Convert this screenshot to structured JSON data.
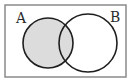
{
  "diagram": {
    "type": "venn",
    "universe": {
      "x": 5,
      "y": 5,
      "width": 121,
      "height": 72,
      "stroke": "#8a8a8a"
    },
    "sets": [
      {
        "label": "A",
        "cx": 48,
        "cy": 43,
        "r": 25,
        "label_x": 16,
        "label_y": 23,
        "shaded": true
      },
      {
        "label": "B",
        "cx": 88,
        "cy": 43,
        "r": 29,
        "label_x": 110,
        "label_y": 22,
        "shaded": false
      }
    ],
    "shaded_region": "A",
    "fill_color": "#dcdcdc",
    "stroke_color": "#1e1e1e"
  }
}
